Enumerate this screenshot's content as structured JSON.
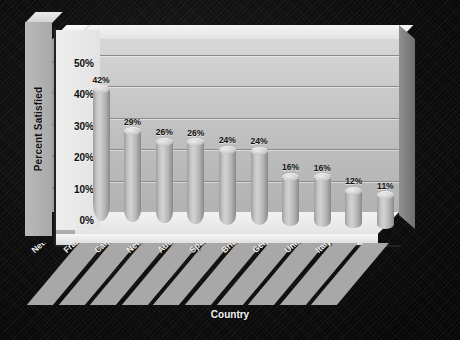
{
  "chart_data": {
    "type": "bar",
    "title": "",
    "xlabel": "Country",
    "ylabel": "Percent Satisfied",
    "categories": [
      "Netherlands",
      "France",
      "Canada",
      "New Zealand",
      "Australia",
      "Spain",
      "Britain",
      "Germany",
      "United States",
      "Italy"
    ],
    "values": [
      42,
      29,
      26,
      26,
      24,
      24,
      16,
      16,
      12,
      11
    ],
    "data_labels": [
      "42%",
      "29%",
      "26%",
      "26%",
      "24%",
      "24%",
      "16%",
      "16%",
      "12%",
      "11%"
    ],
    "ylim": [
      0,
      55
    ],
    "yticks": [
      0,
      10,
      20,
      30,
      40,
      50
    ],
    "ytick_labels": [
      "0%",
      "10%",
      "20%",
      "30%",
      "40%",
      "50%"
    ],
    "grid": true,
    "legend": false,
    "style": "3d-cylinder",
    "colors": {
      "background": "#0a0a0a",
      "wall": "#c4c4c4",
      "floor": "#eeeeee",
      "bar": "#c0c0c0",
      "gridline": "#8b8b8b",
      "label_text": "#111111",
      "axis_title_text": "#f4f4f4"
    }
  },
  "axes": {
    "y_title": "Percent Satisfied",
    "x_title": "Country"
  }
}
